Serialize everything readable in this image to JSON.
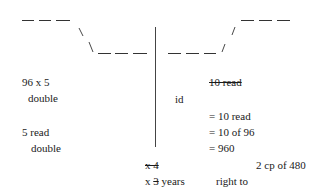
{
  "diagram": {
    "left_top_dashes": "— — —",
    "left_slash": "\\",
    "left_slash2": "\\",
    "left_bottom_dashes": "— — —",
    "right_bottom_dashes": "— — —",
    "right_slash": "/",
    "right_slash2": "/",
    "right_top_dashes": "— — —"
  },
  "left_column": {
    "line1": "96 x 5",
    "line2": "double",
    "line3": "5 read",
    "line4": "double"
  },
  "right_column": {
    "struck_header": "10 read",
    "id_label": "id",
    "eq1": "= 10 read",
    "eq2": "= 10 of 96",
    "eq3": "= 960",
    "note": "2 cp of 480"
  },
  "bottom": {
    "struck_multiplier": "x 4",
    "multiplier_prefix": "x ",
    "multiplier_struck_digit": "3",
    "multiplier_suffix": " years",
    "right_to": "right to"
  }
}
